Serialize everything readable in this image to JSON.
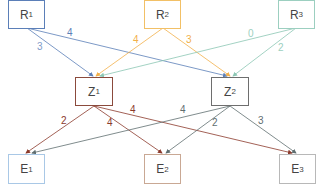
{
  "nodes": {
    "R1": {
      "base": "R",
      "sub": "1",
      "color": "#5b7fb8"
    },
    "R2": {
      "base": "R",
      "sub": "2",
      "color": "#f2c066"
    },
    "R3": {
      "base": "R",
      "sub": "3",
      "color": "#9ccfc0"
    },
    "Z1": {
      "base": "Z",
      "sub": "1",
      "color": "#8b4a3c"
    },
    "Z2": {
      "base": "Z",
      "sub": "2",
      "color": "#6e6e6e"
    },
    "E1": {
      "base": "E",
      "sub": "1",
      "color": "#a9c8e6"
    },
    "E2": {
      "base": "E",
      "sub": "2",
      "color": "#c9a894"
    },
    "E3": {
      "base": "E",
      "sub": "3",
      "color": "#b8b8b8"
    }
  },
  "edges": [
    {
      "from": "R1",
      "to": "Z1",
      "weight": "3",
      "color": "#5b7fb8"
    },
    {
      "from": "R1",
      "to": "Z2",
      "weight": "4",
      "color": "#5b7fb8"
    },
    {
      "from": "R2",
      "to": "Z1",
      "weight": "4",
      "color": "#f2b04a"
    },
    {
      "from": "R2",
      "to": "Z2",
      "weight": "3",
      "color": "#f2b04a"
    },
    {
      "from": "R3",
      "to": "Z1",
      "weight": "0",
      "color": "#8cc7b4"
    },
    {
      "from": "R3",
      "to": "Z2",
      "weight": "2",
      "color": "#8cc7b4"
    },
    {
      "from": "Z1",
      "to": "E1",
      "weight": "2",
      "color": "#8b3a2c"
    },
    {
      "from": "Z1",
      "to": "E2",
      "weight": "4",
      "color": "#8b3a2c"
    },
    {
      "from": "Z1",
      "to": "E3",
      "weight": "4",
      "color": "#8b3a2c"
    },
    {
      "from": "Z2",
      "to": "E1",
      "weight": "4",
      "color": "#5f6e70"
    },
    {
      "from": "Z2",
      "to": "E2",
      "weight": "2",
      "color": "#5f6e70"
    },
    {
      "from": "Z2",
      "to": "E3",
      "weight": "3",
      "color": "#5f6e70"
    }
  ]
}
